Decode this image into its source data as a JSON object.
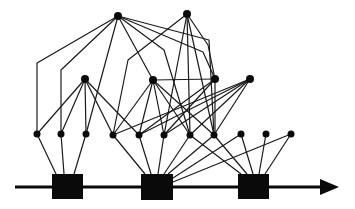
{
  "diagram": {
    "type": "layered-graph-timeline",
    "colors": {
      "stroke": "#1a1a1a",
      "fill": "#0a0a0a",
      "background": "#ffffff"
    },
    "timeline": {
      "x1": 15,
      "y": 187,
      "x2": 322,
      "arrow_tip": 339
    },
    "squares": [
      {
        "id": "S1",
        "x": 52,
        "y": 174,
        "w": 31,
        "h": 25
      },
      {
        "id": "S2",
        "x": 141,
        "y": 174,
        "w": 32,
        "h": 26
      },
      {
        "id": "S3",
        "x": 238,
        "y": 174,
        "w": 31,
        "h": 25
      }
    ],
    "nodes": [
      {
        "id": "T1",
        "x": 118,
        "y": 16,
        "r": 4
      },
      {
        "id": "T2",
        "x": 187,
        "y": 14,
        "r": 4
      },
      {
        "id": "M1",
        "x": 85,
        "y": 79,
        "r": 4
      },
      {
        "id": "M2",
        "x": 153,
        "y": 80,
        "r": 4
      },
      {
        "id": "M3",
        "x": 215,
        "y": 79,
        "r": 4
      },
      {
        "id": "M4",
        "x": 250,
        "y": 79,
        "r": 4
      },
      {
        "id": "B1",
        "x": 37,
        "y": 134,
        "r": 3.5
      },
      {
        "id": "B2",
        "x": 61,
        "y": 134,
        "r": 3.5
      },
      {
        "id": "B3",
        "x": 86,
        "y": 134,
        "r": 3.5
      },
      {
        "id": "B4",
        "x": 113,
        "y": 135,
        "r": 3.5
      },
      {
        "id": "B5",
        "x": 139,
        "y": 135,
        "r": 3.5
      },
      {
        "id": "B6",
        "x": 164,
        "y": 135,
        "r": 3.5
      },
      {
        "id": "B7",
        "x": 190,
        "y": 135,
        "r": 3.5
      },
      {
        "id": "B8",
        "x": 214,
        "y": 135,
        "r": 3.5
      },
      {
        "id": "B9",
        "x": 241,
        "y": 134,
        "r": 3.5
      },
      {
        "id": "B10",
        "x": 266,
        "y": 134,
        "r": 3.5
      },
      {
        "id": "B11",
        "x": 291,
        "y": 134,
        "r": 3.5
      }
    ],
    "edges": [
      {
        "points": [
          [
            118,
            16
          ],
          [
            37,
            63
          ],
          [
            37,
            134
          ]
        ]
      },
      {
        "points": [
          [
            118,
            16
          ],
          [
            61,
            70
          ],
          [
            61,
            134
          ]
        ]
      },
      {
        "points": [
          [
            118,
            16
          ],
          [
            86,
            134
          ]
        ]
      },
      {
        "points": [
          [
            118,
            16
          ],
          [
            153,
            80
          ]
        ]
      },
      {
        "points": [
          [
            118,
            16
          ],
          [
            164,
            50
          ],
          [
            190,
            135
          ]
        ]
      },
      {
        "points": [
          [
            118,
            16
          ],
          [
            203,
            52
          ],
          [
            215,
            79
          ]
        ]
      },
      {
        "points": [
          [
            118,
            16
          ],
          [
            209,
            40
          ],
          [
            214,
            135
          ]
        ]
      },
      {
        "points": [
          [
            187,
            14
          ],
          [
            128,
            60
          ],
          [
            113,
            135
          ]
        ]
      },
      {
        "points": [
          [
            187,
            14
          ],
          [
            164,
            135
          ]
        ]
      },
      {
        "points": [
          [
            187,
            14
          ],
          [
            190,
            135
          ]
        ]
      },
      {
        "points": [
          [
            187,
            14
          ],
          [
            208,
            45
          ],
          [
            215,
            79
          ]
        ]
      },
      {
        "points": [
          [
            187,
            14
          ],
          [
            214,
            135
          ]
        ]
      },
      {
        "points": [
          [
            85,
            79
          ],
          [
            37,
            134
          ]
        ]
      },
      {
        "points": [
          [
            85,
            79
          ],
          [
            61,
            134
          ]
        ]
      },
      {
        "points": [
          [
            85,
            79
          ],
          [
            86,
            134
          ]
        ]
      },
      {
        "points": [
          [
            85,
            79
          ],
          [
            113,
            135
          ]
        ]
      },
      {
        "points": [
          [
            85,
            79
          ],
          [
            139,
            135
          ]
        ]
      },
      {
        "points": [
          [
            153,
            80
          ],
          [
            215,
            79
          ]
        ]
      },
      {
        "points": [
          [
            153,
            80
          ],
          [
            113,
            135
          ]
        ]
      },
      {
        "points": [
          [
            153,
            80
          ],
          [
            139,
            135
          ]
        ]
      },
      {
        "points": [
          [
            153,
            80
          ],
          [
            164,
            135
          ]
        ]
      },
      {
        "points": [
          [
            153,
            80
          ],
          [
            190,
            135
          ]
        ]
      },
      {
        "points": [
          [
            153,
            80
          ],
          [
            214,
            135
          ]
        ]
      },
      {
        "points": [
          [
            215,
            79
          ],
          [
            215,
            135
          ]
        ]
      },
      {
        "points": [
          [
            215,
            79
          ],
          [
            164,
            135
          ]
        ]
      },
      {
        "points": [
          [
            215,
            79
          ],
          [
            139,
            135
          ]
        ]
      },
      {
        "points": [
          [
            250,
            79
          ],
          [
            113,
            135
          ]
        ]
      },
      {
        "points": [
          [
            250,
            79
          ],
          [
            139,
            135
          ]
        ]
      },
      {
        "points": [
          [
            250,
            79
          ],
          [
            164,
            135
          ]
        ]
      },
      {
        "points": [
          [
            250,
            79
          ],
          [
            190,
            135
          ]
        ]
      },
      {
        "points": [
          [
            250,
            79
          ],
          [
            214,
            135
          ]
        ]
      },
      {
        "points": [
          [
            37,
            134
          ],
          [
            56,
            174
          ]
        ]
      },
      {
        "points": [
          [
            61,
            134
          ],
          [
            64,
            174
          ]
        ]
      },
      {
        "points": [
          [
            86,
            134
          ],
          [
            74,
            174
          ]
        ]
      },
      {
        "points": [
          [
            113,
            135
          ],
          [
            145,
            174
          ]
        ]
      },
      {
        "points": [
          [
            139,
            135
          ],
          [
            151,
            174
          ]
        ]
      },
      {
        "points": [
          [
            164,
            135
          ],
          [
            158,
            174
          ]
        ]
      },
      {
        "points": [
          [
            190,
            135
          ],
          [
            164,
            174
          ]
        ]
      },
      {
        "points": [
          [
            214,
            135
          ],
          [
            168,
            174
          ]
        ]
      },
      {
        "points": [
          [
            291,
            134
          ],
          [
            173,
            182
          ]
        ]
      },
      {
        "points": [
          [
            190,
            135
          ],
          [
            241,
            174
          ]
        ]
      },
      {
        "points": [
          [
            214,
            135
          ],
          [
            247,
            174
          ]
        ]
      },
      {
        "points": [
          [
            241,
            134
          ],
          [
            253,
            174
          ]
        ]
      },
      {
        "points": [
          [
            266,
            134
          ],
          [
            259,
            174
          ]
        ]
      },
      {
        "points": [
          [
            291,
            134
          ],
          [
            265,
            174
          ]
        ]
      },
      {
        "points": [
          [
            241,
            134
          ],
          [
            173,
            178
          ]
        ]
      }
    ]
  }
}
